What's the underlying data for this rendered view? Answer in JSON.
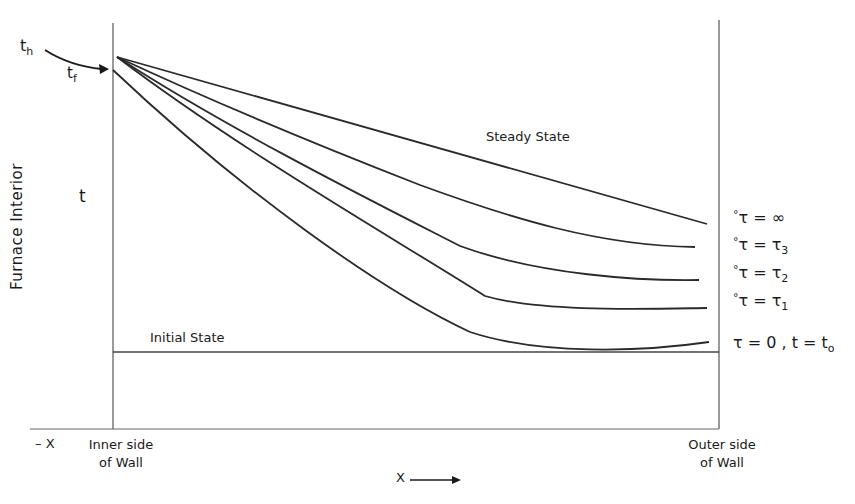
{
  "diagram": {
    "labels": {
      "t_h": "t",
      "t_h_sub": "h",
      "t_f": "t",
      "t_f_sub": "f",
      "y_axis": "Furnace Interior",
      "y_var": "t",
      "steady_state": "Steady State",
      "initial_state": "Initial State",
      "neg_x": "– X",
      "inner_wall_1": "Inner side",
      "inner_wall_2": "of Wall",
      "outer_wall_1": "Outer side",
      "outer_wall_2": "of Wall",
      "x_axis": "X"
    },
    "legend": [
      {
        "marker": "°",
        "lhs": "τ",
        "eq": " = ",
        "rhs": "∞",
        "rhs_sub": ""
      },
      {
        "marker": "°",
        "lhs": "τ",
        "eq": " = ",
        "rhs": "τ",
        "rhs_sub": "3"
      },
      {
        "marker": "°",
        "lhs": "τ",
        "eq": " = ",
        "rhs": "τ",
        "rhs_sub": "2"
      },
      {
        "marker": "°",
        "lhs": "τ",
        "eq": " = ",
        "rhs": "τ",
        "rhs_sub": "1"
      },
      {
        "marker": "",
        "lhs": "τ",
        "eq": " = ",
        "rhs": "0 , t = t",
        "rhs_sub": "o"
      }
    ],
    "curves": [
      {
        "name": "tau-infinity (steady state)",
        "path": "M117,57 L707,224"
      },
      {
        "name": "tau-3",
        "path": "M117,57 C220,105 330,150 420,185 C510,218 600,246 695,247"
      },
      {
        "name": "tau-2",
        "path": "M117,57 C230,130 370,200 460,246 C540,275 640,281 699,280"
      },
      {
        "name": "tau-1",
        "path": "M117,57 C240,150 390,236 485,296 C540,312 640,309 707,308"
      },
      {
        "name": "tau-early",
        "path": "M113,70 C240,190 380,290 470,332 C540,355 640,352 709,342"
      }
    ],
    "colors": {
      "line": "#2a2a2a",
      "axis": "#555555"
    }
  }
}
